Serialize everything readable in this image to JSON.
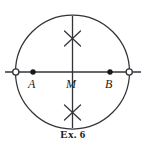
{
  "figure": {
    "caption": "Ex. 6",
    "stroke_color": "#33333a",
    "fill_color": "#1a1a1a",
    "background_color": "#ffffff",
    "circle": {
      "name": "construction-circle",
      "cx": 72.5,
      "cy": 72,
      "r": 57
    },
    "horizontal_line": {
      "name": "horizontal-diameter",
      "x1": 5,
      "y1": 72,
      "x2": 141,
      "y2": 72
    },
    "vertical_line": {
      "name": "vertical-diameter",
      "x1": 72.5,
      "y1": 16,
      "x2": 72.5,
      "y2": 128
    },
    "open_points": [
      {
        "name": "left-intersection",
        "cx": 15.8,
        "cy": 72,
        "r": 3.1
      },
      {
        "name": "right-intersection",
        "cx": 129.2,
        "cy": 72,
        "r": 3.1
      }
    ],
    "solid_points": [
      {
        "name": "point-A",
        "cx": 33,
        "cy": 72,
        "r": 2.7
      },
      {
        "name": "point-B",
        "cx": 110,
        "cy": 72,
        "r": 2.7
      }
    ],
    "arc_crossings": [
      {
        "name": "upper-arc-crossing",
        "cx": 72.5,
        "cy": 38,
        "size": 9
      },
      {
        "name": "lower-arc-crossing",
        "cx": 72.5,
        "cy": 112,
        "size": 9
      }
    ],
    "labels": {
      "a": "A",
      "m": "M",
      "b": "B"
    }
  }
}
